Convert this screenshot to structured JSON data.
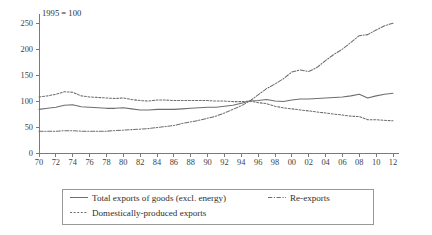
{
  "chart_data": {
    "type": "line",
    "title": "",
    "note": "1995 = 100",
    "xlabel": "",
    "ylabel": "",
    "xlim": [
      1970,
      2012
    ],
    "ylim": [
      0,
      260
    ],
    "y_ticks": [
      0,
      50,
      100,
      150,
      200,
      250
    ],
    "x_ticks": [
      1970,
      1972,
      1974,
      1976,
      1978,
      1980,
      1982,
      1984,
      1986,
      1988,
      1990,
      1992,
      1994,
      1996,
      1998,
      2000,
      2002,
      2004,
      2006,
      2008,
      2010,
      2012
    ],
    "x_tick_labels": [
      "70",
      "72",
      "74",
      "76",
      "78",
      "80",
      "82",
      "84",
      "86",
      "88",
      "90",
      "92",
      "94",
      "96",
      "98",
      "00",
      "02",
      "04",
      "06",
      "08",
      "10",
      "12"
    ],
    "grid": false,
    "legend_position": "below",
    "x": [
      1970,
      1971,
      1972,
      1973,
      1974,
      1975,
      1976,
      1977,
      1978,
      1979,
      1980,
      1981,
      1982,
      1983,
      1984,
      1985,
      1986,
      1987,
      1988,
      1989,
      1990,
      1991,
      1992,
      1993,
      1994,
      1995,
      1996,
      1997,
      1998,
      1999,
      2000,
      2001,
      2002,
      2003,
      2004,
      2005,
      2006,
      2007,
      2008,
      2009,
      2010,
      2011,
      2012
    ],
    "series": [
      {
        "name": "Total exports of goods (excl. energy)",
        "style": "solid",
        "values": [
          84,
          86,
          88,
          92,
          93,
          89,
          88,
          87,
          86,
          86,
          87,
          85,
          83,
          83,
          84,
          84,
          84,
          85,
          86,
          87,
          88,
          88,
          90,
          92,
          96,
          100,
          101,
          103,
          100,
          99,
          102,
          104,
          104,
          105,
          106,
          107,
          108,
          110,
          113,
          106,
          110,
          113,
          115
        ]
      },
      {
        "name": "Domestically-produced exports",
        "style": "dotted",
        "values": [
          108,
          110,
          113,
          118,
          117,
          110,
          108,
          107,
          106,
          105,
          106,
          103,
          101,
          100,
          102,
          102,
          101,
          101,
          101,
          101,
          101,
          100,
          100,
          99,
          99,
          100,
          97,
          95,
          90,
          87,
          85,
          83,
          81,
          79,
          77,
          75,
          73,
          71,
          70,
          64,
          64,
          63,
          62
        ]
      },
      {
        "name": "Re-exports",
        "style": "dashdot",
        "values": [
          42,
          42,
          42,
          43,
          43,
          42,
          42,
          42,
          42,
          43,
          44,
          45,
          46,
          47,
          49,
          51,
          53,
          57,
          60,
          63,
          67,
          71,
          77,
          84,
          91,
          100,
          112,
          124,
          133,
          143,
          156,
          160,
          157,
          165,
          178,
          190,
          200,
          213,
          226,
          228,
          237,
          245,
          250
        ]
      }
    ]
  },
  "legend": {
    "items": [
      {
        "label": "Total exports of goods (excl. energy)",
        "style": "solid"
      },
      {
        "label": "Re-exports",
        "style": "dashdot"
      },
      {
        "label": "Domestically-produced exports",
        "style": "dotted"
      }
    ]
  }
}
